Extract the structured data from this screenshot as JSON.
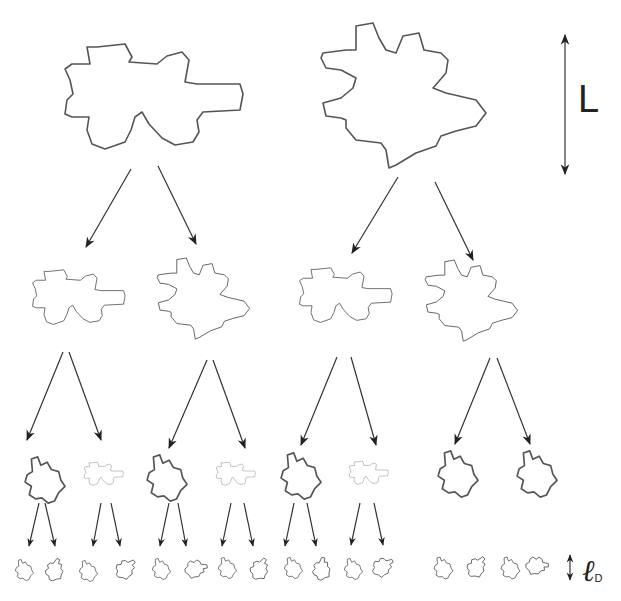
{
  "diagram": {
    "title": "",
    "labels": {
      "large_scale": "L",
      "small_scale_symbol": "ℓ",
      "small_scale_subscript": "D"
    },
    "levels": [
      {
        "level": 0,
        "count": 2,
        "scale": 1.0
      },
      {
        "level": 1,
        "count": 4,
        "scale": 0.5
      },
      {
        "level": 2,
        "count": 8,
        "scale": 0.25
      },
      {
        "level": 3,
        "count": 16,
        "scale": 0.12
      }
    ],
    "colors": {
      "outline": "#555555",
      "arrow": "#333333",
      "background": "#ffffff"
    }
  }
}
